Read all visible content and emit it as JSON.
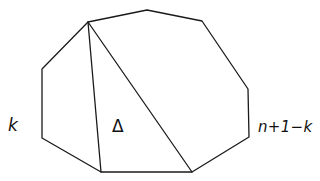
{
  "diagram": {
    "polygon": {
      "vertices": [
        [
          42,
          69
        ],
        [
          88,
          22
        ],
        [
          147,
          10
        ],
        [
          202,
          21
        ],
        [
          248,
          89
        ],
        [
          249,
          137
        ],
        [
          192,
          172
        ],
        [
          101,
          172
        ],
        [
          42,
          138
        ]
      ]
    },
    "diagonals": [
      {
        "from": [
          88,
          22
        ],
        "to": [
          101,
          172
        ]
      },
      {
        "from": [
          88,
          22
        ],
        "to": [
          192,
          172
        ]
      }
    ],
    "labels": {
      "left": {
        "text": "k",
        "x": 8,
        "y": 117
      },
      "triangle": {
        "text": "Δ",
        "x": 112,
        "y": 118
      },
      "right": {
        "text": "n+1−k",
        "x": 258,
        "y": 120
      }
    },
    "colors": {
      "stroke": "#1a1a1a",
      "text": "#111111",
      "background": "#ffffff"
    }
  }
}
